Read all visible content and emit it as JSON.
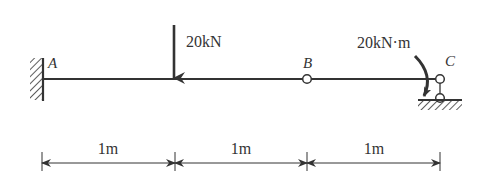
{
  "diagram": {
    "type": "beam",
    "points": [
      {
        "name": "A",
        "support": "fixed"
      },
      {
        "name": "B",
        "support": "internal-hinge"
      },
      {
        "name": "C",
        "support": "roller"
      }
    ],
    "loads": {
      "point_force": {
        "label": "20kN",
        "direction": "down"
      },
      "moment": {
        "label": "20kN·m",
        "direction": "clockwise"
      }
    },
    "dimensions": [
      "1m",
      "1m",
      "1m"
    ],
    "colors": {
      "stroke": "#333333",
      "background": "#ffffff"
    }
  }
}
